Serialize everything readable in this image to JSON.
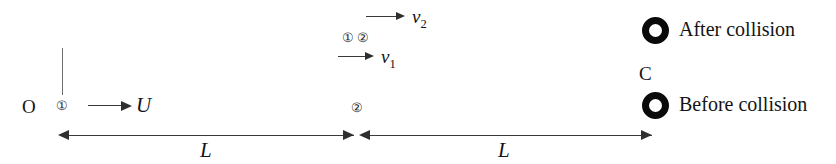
{
  "figure": {
    "origin_label": "O",
    "markers": {
      "ball1": "①",
      "ball2": "②",
      "pair_first": "①",
      "pair_second": "②",
      "midpoint_ball2": "②"
    },
    "velocities": {
      "initial": "U",
      "v1_base": "v",
      "v1_sub": "1",
      "v2_base": "v",
      "v2_sub": "2"
    },
    "dimensions": {
      "left_span": "L",
      "right_span": "L"
    },
    "wall_label": "C",
    "legend": [
      {
        "marker": "ring",
        "label": "After collision"
      },
      {
        "marker": "ring",
        "label": "Before collision"
      }
    ],
    "colors": {
      "ink": "#141414",
      "rule": "#3a3a3a",
      "marker_outline": "#2b2b2b",
      "ring": "#0a0a0a",
      "hanger": "#6d6d6d",
      "background": "#ffffff"
    }
  }
}
